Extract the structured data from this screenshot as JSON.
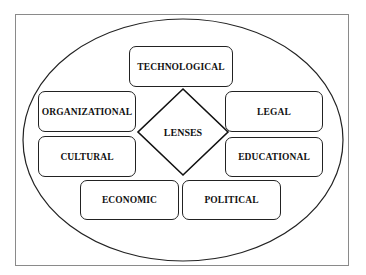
{
  "diagram": {
    "center": {
      "label": "LENSES"
    },
    "lenses": [
      {
        "label": "TECHNOLOGICAL"
      },
      {
        "label": "ORGANIZATIONAL"
      },
      {
        "label": "LEGAL"
      },
      {
        "label": "CULTURAL"
      },
      {
        "label": "EDUCATIONAL"
      },
      {
        "label": "ECONOMIC"
      },
      {
        "label": "POLITICAL"
      }
    ]
  }
}
